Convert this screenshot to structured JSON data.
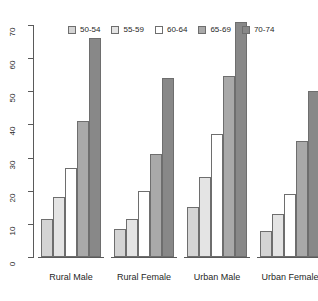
{
  "chart_data": {
    "type": "bar",
    "title": "",
    "subtitle": "",
    "xlabel": "",
    "ylabel": "",
    "categories": [
      "Rural Male",
      "Rural Female",
      "Urban Male",
      "Urban Female"
    ],
    "series": [
      {
        "name": "50-54",
        "color": "#d4d4d4",
        "values": [
          11.5,
          8.5,
          15,
          8
        ]
      },
      {
        "name": "55-59",
        "color": "#e4e4e4",
        "values": [
          18,
          11.5,
          24,
          13
        ]
      },
      {
        "name": "60-64",
        "color": "#ffffff",
        "values": [
          27,
          20,
          37,
          19
        ]
      },
      {
        "name": "65-69",
        "color": "#a9a9a9",
        "values": [
          41,
          31,
          54.5,
          35
        ]
      },
      {
        "name": "70-74",
        "color": "#888888",
        "values": [
          66,
          54,
          71,
          50
        ]
      }
    ],
    "ylim": [
      0,
      70
    ],
    "yticks": [
      0,
      10,
      20,
      30,
      40,
      50,
      60,
      70
    ],
    "ytick_labels": [
      "0",
      "10",
      "20",
      "30",
      "40",
      "50",
      "60",
      "70"
    ],
    "grid": false,
    "legend_position": "top-center",
    "axis_color": "#5a5a5a",
    "bar_border_color": "#6e6e6e",
    "background": "#ffffff"
  },
  "legend": {
    "items": [
      {
        "label": "50-54"
      },
      {
        "label": "55-59"
      },
      {
        "label": "60-64"
      },
      {
        "label": "65-69"
      },
      {
        "label": "70-74"
      }
    ]
  },
  "axis": {
    "y_labels": [
      "0",
      "10",
      "20",
      "30",
      "40",
      "50",
      "60",
      "70"
    ]
  },
  "groups": [
    {
      "label": "Rural Male"
    },
    {
      "label": "Rural Female"
    },
    {
      "label": "Urban Male"
    },
    {
      "label": "Urban Female"
    }
  ]
}
